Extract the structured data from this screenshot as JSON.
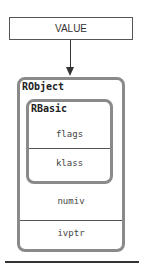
{
  "diagram": {
    "pointer": {
      "label": "VALUE"
    },
    "outer_struct": {
      "name": "RObject",
      "fields": [
        "numiv",
        "ivptr"
      ]
    },
    "inner_struct": {
      "name": "RBasic",
      "fields": [
        "flags",
        "klass"
      ]
    }
  },
  "colors": {
    "box_border": "#8a8a8a",
    "line": "#333333",
    "background": "#ffffff"
  }
}
